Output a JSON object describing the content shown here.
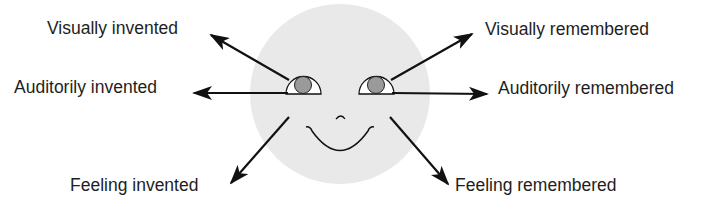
{
  "diagram": {
    "type": "eye-accessing-cues",
    "labels": {
      "visually_invented": "Visually invented",
      "auditorily_invented": "Auditorily invented",
      "feeling_invented": "Feeling invented",
      "visually_remembered": "Visually remembered",
      "auditorily_remembered": "Auditorily remembered",
      "feeling_remembered": "Feeling remembered"
    },
    "colors": {
      "face": "#e9e9e9",
      "pupil": "#9a9a9a",
      "eye_white": "#ffffff",
      "stroke": "#111111",
      "text": "#1e1e1e"
    }
  }
}
